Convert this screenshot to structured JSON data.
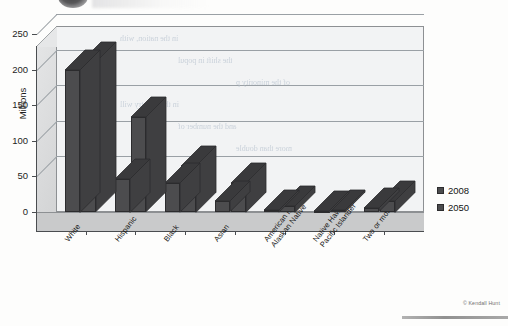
{
  "chart_data": {
    "type": "bar",
    "title": "",
    "xlabel": "",
    "ylabel": "Millions",
    "ylim": [
      0,
      250
    ],
    "yticks": [
      0,
      50,
      100,
      150,
      200,
      250
    ],
    "grid": true,
    "legend_position": "right",
    "three_d": true,
    "categories": [
      "White",
      "Hispanic",
      "Black",
      "Asian",
      "American Indian/ Alaskan Native",
      "Native Hawaiian/ Pacific Islander",
      "Two or more races"
    ],
    "category_lines": [
      [
        "White"
      ],
      [
        "Hispanic"
      ],
      [
        "Black"
      ],
      [
        "Asian"
      ],
      [
        "American Indian/",
        "Alaskan Native"
      ],
      [
        "Native Hawaiian/",
        "Pacific Islander"
      ],
      [
        "Two or more races"
      ]
    ],
    "series": [
      {
        "name": "2008",
        "color": "#4c4c4e",
        "values": [
          200,
          47,
          41,
          15,
          3,
          1,
          5
        ]
      },
      {
        "name": "2050",
        "color": "#4c4c4e",
        "values": [
          210,
          133,
          65,
          41,
          9,
          3,
          16
        ]
      }
    ]
  },
  "axis": {
    "y_label": "Millions",
    "y_ticks": [
      "250",
      "200",
      "150",
      "100",
      "50",
      "0"
    ]
  },
  "legend": {
    "items": [
      {
        "label": "2008",
        "color": "#4c4c4e"
      },
      {
        "label": "2050",
        "color": "#4c4c4e"
      }
    ]
  },
  "credit": {
    "text": "© Kendall Hunt"
  },
  "bleed_text": {
    "lines": [
      "in the nation, with",
      "the shift in popul",
      "of the minority p",
      "in the country will",
      "and the number of",
      "more than double"
    ]
  },
  "colors": {
    "bar_front": "#4c4c4e",
    "bar_top": "#3a3a3c",
    "bar_side": "#3f3f41",
    "plot_background": "#f2f3f4",
    "floor": "#c9cacb",
    "wall": "#dcdddd",
    "gridline": "#9aa0a5",
    "axis": "#4a4d50",
    "text": "#151515"
  }
}
